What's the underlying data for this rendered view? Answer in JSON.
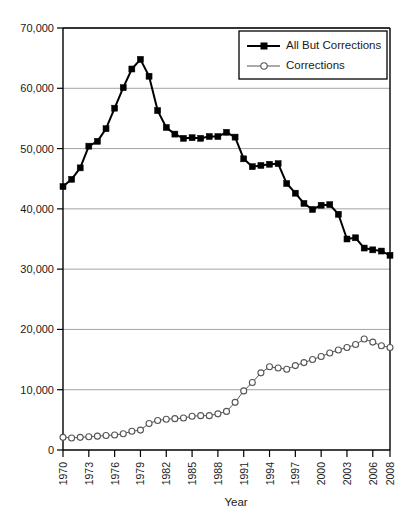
{
  "chart_data": {
    "type": "line",
    "title": "",
    "xlabel": "Year",
    "ylabel": "",
    "xlim": [
      1970,
      2008
    ],
    "ylim": [
      0,
      70000
    ],
    "grid": true,
    "legend_position": "top-right",
    "y_ticks": [
      "0",
      "10,000",
      "20,000",
      "30,000",
      "40,000",
      "50,000",
      "60,000",
      "70,000"
    ],
    "y_tick_values": [
      0,
      10000,
      20000,
      30000,
      40000,
      50000,
      60000,
      70000
    ],
    "x_tick_labels": [
      "1970",
      "1973",
      "1976",
      "1979",
      "1982",
      "1985",
      "1988",
      "1991",
      "1994",
      "1997",
      "2000",
      "2003",
      "2006",
      "2008"
    ],
    "x_tick_values": [
      1970,
      1973,
      1976,
      1979,
      1982,
      1985,
      1988,
      1991,
      1994,
      1997,
      2000,
      2003,
      2006,
      2008
    ],
    "x": [
      1970,
      1971,
      1972,
      1973,
      1974,
      1975,
      1976,
      1977,
      1978,
      1979,
      1980,
      1981,
      1982,
      1983,
      1984,
      1985,
      1986,
      1987,
      1988,
      1989,
      1990,
      1991,
      1992,
      1993,
      1994,
      1995,
      1996,
      1997,
      1998,
      1999,
      2000,
      2001,
      2002,
      2003,
      2004,
      2005,
      2006,
      2007,
      2008
    ],
    "series": [
      {
        "name": "All But Corrections",
        "marker": "filled-square",
        "color": "#000000",
        "line_width": 2.0,
        "values": [
          43700,
          44900,
          46800,
          50400,
          51200,
          53300,
          56700,
          60100,
          63200,
          64800,
          62000,
          56300,
          53500,
          52400,
          51700,
          51800,
          51700,
          52000,
          52000,
          52700,
          51900,
          48300,
          47000,
          47200,
          47400,
          47500,
          44200,
          42600,
          40900,
          39900,
          40600,
          40700,
          39100,
          35000,
          35200,
          33500,
          33200,
          33000,
          32300
        ]
      },
      {
        "name": "Corrections",
        "marker": "open-circle",
        "color": "#555555",
        "line_width": 1.0,
        "values": [
          2100,
          2000,
          2100,
          2200,
          2300,
          2400,
          2500,
          2700,
          3100,
          3300,
          4400,
          4900,
          5100,
          5200,
          5300,
          5600,
          5700,
          5700,
          6000,
          6400,
          7900,
          9800,
          11200,
          12800,
          13800,
          13600,
          13400,
          14000,
          14500,
          15000,
          15500,
          16100,
          16600,
          17000,
          17500,
          18400,
          17900,
          17300,
          17000
        ]
      }
    ]
  },
  "legend": {
    "entries": [
      {
        "label": "All But Corrections"
      },
      {
        "label": "Corrections"
      }
    ]
  },
  "axes": {
    "x_title": "Year"
  }
}
